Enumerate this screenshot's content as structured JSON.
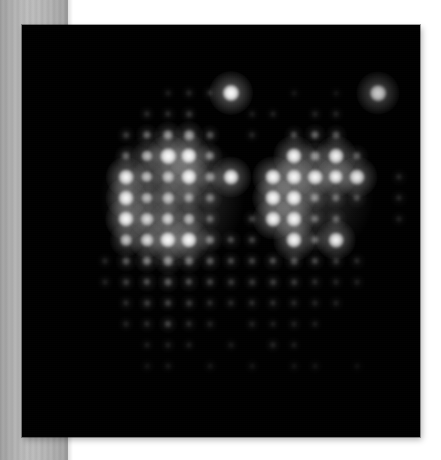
{
  "page": {
    "background_color": "#ffffff",
    "width": 441,
    "height": 460
  },
  "side_band": {
    "name": "left-gray-band",
    "color_light": "#bdbdbd",
    "color_dark": "#9b9b9b",
    "width": 68
  },
  "image_panel": {
    "name": "fluorescence-image",
    "background_color": "#000000",
    "left": 22,
    "top": 25,
    "width": 398,
    "height": 412,
    "caption": ""
  },
  "chart_data": {
    "type": "heatmap",
    "title": "",
    "subtitle": "",
    "xlabel": "",
    "ylabel": "",
    "grid": false,
    "legend": "none",
    "lattice": {
      "origin_x": 63,
      "origin_y": 72,
      "spacing_x": 21.0,
      "spacing_y": 21.0,
      "columns": 17,
      "rows": 17
    },
    "colormap": "grayscale",
    "value_min": 0,
    "value_max": 1,
    "points": [
      {
        "col": 8,
        "row": 1,
        "v": 1.0
      },
      {
        "col": 15,
        "row": 1,
        "v": 0.97
      },
      {
        "col": 6,
        "row": 1,
        "v": 0.1
      },
      {
        "col": 7,
        "row": 1,
        "v": 0.12
      },
      {
        "col": 5,
        "row": 1,
        "v": 0.07
      },
      {
        "col": 11,
        "row": 1,
        "v": 0.05
      },
      {
        "col": 13,
        "row": 1,
        "v": 0.05
      },
      {
        "col": 4,
        "row": 2,
        "v": 0.11
      },
      {
        "col": 5,
        "row": 2,
        "v": 0.12
      },
      {
        "col": 6,
        "row": 2,
        "v": 0.14
      },
      {
        "col": 9,
        "row": 2,
        "v": 0.07
      },
      {
        "col": 10,
        "row": 2,
        "v": 0.08
      },
      {
        "col": 12,
        "row": 2,
        "v": 0.09
      },
      {
        "col": 13,
        "row": 2,
        "v": 0.1
      },
      {
        "col": 3,
        "row": 3,
        "v": 0.16
      },
      {
        "col": 4,
        "row": 3,
        "v": 0.3
      },
      {
        "col": 5,
        "row": 3,
        "v": 0.46
      },
      {
        "col": 6,
        "row": 3,
        "v": 0.5
      },
      {
        "col": 7,
        "row": 3,
        "v": 0.24
      },
      {
        "col": 9,
        "row": 3,
        "v": 0.1
      },
      {
        "col": 11,
        "row": 3,
        "v": 0.22
      },
      {
        "col": 12,
        "row": 3,
        "v": 0.3
      },
      {
        "col": 13,
        "row": 3,
        "v": 0.26
      },
      {
        "col": 5,
        "row": 4,
        "v": 0.96
      },
      {
        "col": 6,
        "row": 4,
        "v": 0.95
      },
      {
        "col": 4,
        "row": 4,
        "v": 0.55
      },
      {
        "col": 3,
        "row": 4,
        "v": 0.3
      },
      {
        "col": 7,
        "row": 4,
        "v": 0.4
      },
      {
        "col": 11,
        "row": 4,
        "v": 0.92
      },
      {
        "col": 13,
        "row": 4,
        "v": 0.9
      },
      {
        "col": 12,
        "row": 4,
        "v": 0.45
      },
      {
        "col": 14,
        "row": 4,
        "v": 0.3
      },
      {
        "col": 3,
        "row": 5,
        "v": 0.88
      },
      {
        "col": 5,
        "row": 5,
        "v": 0.62
      },
      {
        "col": 6,
        "row": 5,
        "v": 0.93
      },
      {
        "col": 8,
        "row": 5,
        "v": 0.9
      },
      {
        "col": 4,
        "row": 5,
        "v": 0.58
      },
      {
        "col": 7,
        "row": 5,
        "v": 0.45
      },
      {
        "col": 10,
        "row": 5,
        "v": 0.92
      },
      {
        "col": 11,
        "row": 5,
        "v": 0.9
      },
      {
        "col": 12,
        "row": 5,
        "v": 0.88
      },
      {
        "col": 13,
        "row": 5,
        "v": 0.86
      },
      {
        "col": 14,
        "row": 5,
        "v": 0.9
      },
      {
        "col": 16,
        "row": 5,
        "v": 0.12
      },
      {
        "col": 3,
        "row": 6,
        "v": 0.9
      },
      {
        "col": 4,
        "row": 6,
        "v": 0.55
      },
      {
        "col": 5,
        "row": 6,
        "v": 0.6
      },
      {
        "col": 6,
        "row": 6,
        "v": 0.48
      },
      {
        "col": 7,
        "row": 6,
        "v": 0.35
      },
      {
        "col": 10,
        "row": 6,
        "v": 0.93
      },
      {
        "col": 11,
        "row": 6,
        "v": 0.92
      },
      {
        "col": 12,
        "row": 6,
        "v": 0.4
      },
      {
        "col": 13,
        "row": 6,
        "v": 0.3
      },
      {
        "col": 14,
        "row": 6,
        "v": 0.22
      },
      {
        "col": 16,
        "row": 6,
        "v": 0.12
      },
      {
        "col": 3,
        "row": 7,
        "v": 0.92
      },
      {
        "col": 4,
        "row": 7,
        "v": 0.7
      },
      {
        "col": 5,
        "row": 7,
        "v": 0.68
      },
      {
        "col": 6,
        "row": 7,
        "v": 0.55
      },
      {
        "col": 7,
        "row": 7,
        "v": 0.28
      },
      {
        "col": 9,
        "row": 7,
        "v": 0.18
      },
      {
        "col": 10,
        "row": 7,
        "v": 0.9
      },
      {
        "col": 11,
        "row": 7,
        "v": 0.9
      },
      {
        "col": 12,
        "row": 7,
        "v": 0.3
      },
      {
        "col": 13,
        "row": 7,
        "v": 0.26
      },
      {
        "col": 16,
        "row": 7,
        "v": 0.1
      },
      {
        "col": 3,
        "row": 8,
        "v": 0.62
      },
      {
        "col": 4,
        "row": 8,
        "v": 0.72
      },
      {
        "col": 5,
        "row": 8,
        "v": 0.95
      },
      {
        "col": 6,
        "row": 8,
        "v": 0.93
      },
      {
        "col": 7,
        "row": 8,
        "v": 0.38
      },
      {
        "col": 8,
        "row": 8,
        "v": 0.22
      },
      {
        "col": 9,
        "row": 8,
        "v": 0.18
      },
      {
        "col": 11,
        "row": 8,
        "v": 0.92
      },
      {
        "col": 13,
        "row": 8,
        "v": 0.88
      },
      {
        "col": 12,
        "row": 8,
        "v": 0.3
      },
      {
        "col": 2,
        "row": 9,
        "v": 0.1
      },
      {
        "col": 3,
        "row": 9,
        "v": 0.25
      },
      {
        "col": 4,
        "row": 9,
        "v": 0.38
      },
      {
        "col": 5,
        "row": 9,
        "v": 0.45
      },
      {
        "col": 6,
        "row": 9,
        "v": 0.35
      },
      {
        "col": 7,
        "row": 9,
        "v": 0.26
      },
      {
        "col": 8,
        "row": 9,
        "v": 0.2
      },
      {
        "col": 9,
        "row": 9,
        "v": 0.18
      },
      {
        "col": 10,
        "row": 9,
        "v": 0.22
      },
      {
        "col": 11,
        "row": 9,
        "v": 0.24
      },
      {
        "col": 12,
        "row": 9,
        "v": 0.2
      },
      {
        "col": 13,
        "row": 9,
        "v": 0.16
      },
      {
        "col": 14,
        "row": 9,
        "v": 0.12
      },
      {
        "col": 2,
        "row": 10,
        "v": 0.09
      },
      {
        "col": 3,
        "row": 10,
        "v": 0.16
      },
      {
        "col": 4,
        "row": 10,
        "v": 0.22
      },
      {
        "col": 5,
        "row": 10,
        "v": 0.26
      },
      {
        "col": 6,
        "row": 10,
        "v": 0.22
      },
      {
        "col": 7,
        "row": 10,
        "v": 0.18
      },
      {
        "col": 8,
        "row": 10,
        "v": 0.15
      },
      {
        "col": 9,
        "row": 10,
        "v": 0.14
      },
      {
        "col": 10,
        "row": 10,
        "v": 0.16
      },
      {
        "col": 11,
        "row": 10,
        "v": 0.15
      },
      {
        "col": 12,
        "row": 10,
        "v": 0.12
      },
      {
        "col": 13,
        "row": 10,
        "v": 0.1
      },
      {
        "col": 14,
        "row": 10,
        "v": 0.09
      },
      {
        "col": 3,
        "row": 11,
        "v": 0.12
      },
      {
        "col": 4,
        "row": 11,
        "v": 0.16
      },
      {
        "col": 5,
        "row": 11,
        "v": 0.18
      },
      {
        "col": 6,
        "row": 11,
        "v": 0.15
      },
      {
        "col": 7,
        "row": 11,
        "v": 0.12
      },
      {
        "col": 8,
        "row": 11,
        "v": 0.11
      },
      {
        "col": 9,
        "row": 11,
        "v": 0.12
      },
      {
        "col": 10,
        "row": 11,
        "v": 0.12
      },
      {
        "col": 11,
        "row": 11,
        "v": 0.11
      },
      {
        "col": 12,
        "row": 11,
        "v": 0.1
      },
      {
        "col": 13,
        "row": 11,
        "v": 0.09
      },
      {
        "col": 3,
        "row": 12,
        "v": 0.1
      },
      {
        "col": 4,
        "row": 12,
        "v": 0.12
      },
      {
        "col": 5,
        "row": 12,
        "v": 0.2
      },
      {
        "col": 6,
        "row": 12,
        "v": 0.12
      },
      {
        "col": 7,
        "row": 12,
        "v": 0.09
      },
      {
        "col": 9,
        "row": 12,
        "v": 0.09
      },
      {
        "col": 10,
        "row": 12,
        "v": 0.08
      },
      {
        "col": 11,
        "row": 12,
        "v": 0.09
      },
      {
        "col": 12,
        "row": 12,
        "v": 0.08
      },
      {
        "col": 4,
        "row": 13,
        "v": 0.08
      },
      {
        "col": 5,
        "row": 13,
        "v": 0.09
      },
      {
        "col": 6,
        "row": 13,
        "v": 0.08
      },
      {
        "col": 8,
        "row": 13,
        "v": 0.07
      },
      {
        "col": 10,
        "row": 13,
        "v": 0.11
      },
      {
        "col": 11,
        "row": 13,
        "v": 0.08
      },
      {
        "col": 4,
        "row": 14,
        "v": 0.06
      },
      {
        "col": 5,
        "row": 14,
        "v": 0.07
      },
      {
        "col": 7,
        "row": 14,
        "v": 0.06
      },
      {
        "col": 9,
        "row": 14,
        "v": 0.06
      },
      {
        "col": 11,
        "row": 14,
        "v": 0.06
      },
      {
        "col": 12,
        "row": 14,
        "v": 0.06
      },
      {
        "col": 14,
        "row": 14,
        "v": 0.05
      }
    ],
    "clusters": [
      {
        "name": "left-cluster",
        "center_col": 5.2,
        "center_row": 6.0,
        "radius_sites": 3.2,
        "glow": 0.22
      },
      {
        "name": "right-cluster",
        "center_col": 12.0,
        "center_row": 6.0,
        "radius_sites": 2.6,
        "glow": 0.16
      }
    ],
    "isolated_bright_sites": [
      {
        "name": "isolated-site-a",
        "col": 8,
        "row": 1,
        "v": 1.0
      },
      {
        "name": "isolated-site-b",
        "col": 15,
        "row": 1,
        "v": 0.97
      }
    ]
  }
}
